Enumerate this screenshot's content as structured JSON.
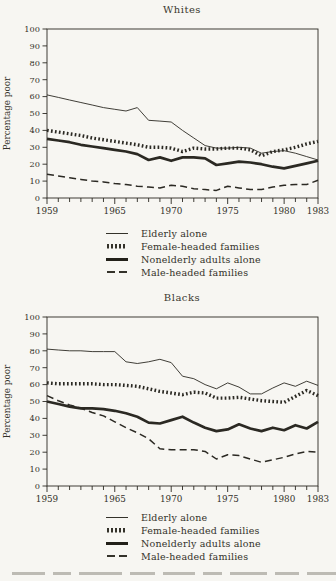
{
  "colors": {
    "ink": "#2b2923",
    "paper": "#f7f6f2"
  },
  "legend_items": [
    {
      "label": "Elderly alone",
      "style": "thin-solid"
    },
    {
      "label": "Female-headed families",
      "style": "dotted-thick"
    },
    {
      "label": "Nonelderly adults alone",
      "style": "thick-solid"
    },
    {
      "label": "Male-headed families",
      "style": "dashed"
    }
  ],
  "chart_data": [
    {
      "type": "line",
      "title": "Whites",
      "ylabel": "Percentage poor",
      "ylim": [
        0,
        100
      ],
      "y_tick_step": 10,
      "grid": false,
      "legend_position": "below",
      "x": [
        1959,
        1960,
        1961,
        1962,
        1963,
        1964,
        1965,
        1966,
        1967,
        1968,
        1969,
        1970,
        1971,
        1972,
        1973,
        1974,
        1975,
        1976,
        1977,
        1978,
        1979,
        1980,
        1981,
        1982,
        1983
      ],
      "x_axis_labeled_ticks": [
        1959,
        1965,
        1970,
        1975,
        1980,
        1983
      ],
      "series": [
        {
          "name": "Elderly alone",
          "style": "thin-solid",
          "values": [
            61,
            59.5,
            58,
            56.5,
            55,
            53.5,
            52.5,
            51.5,
            53.5,
            46,
            45.5,
            45,
            40,
            35.5,
            31,
            29.5,
            29.5,
            30,
            29.5,
            26.5,
            27.5,
            28,
            26.5,
            24.5,
            22.5
          ]
        },
        {
          "name": "Female-headed families",
          "style": "dotted-thick",
          "values": [
            40,
            39,
            38,
            37,
            35.5,
            34.5,
            33.5,
            32.5,
            31.5,
            30,
            30,
            29.5,
            27.5,
            29.5,
            29,
            29,
            29.5,
            29.5,
            28.5,
            25,
            27.5,
            28.5,
            30,
            32,
            33.5
          ]
        },
        {
          "name": "Nonelderly adults alone",
          "style": "thick-solid",
          "values": [
            35,
            34,
            33,
            31.5,
            30.5,
            29.5,
            28.5,
            27.5,
            26,
            22.5,
            24,
            22,
            24,
            24,
            23.5,
            19.5,
            20.5,
            21.5,
            21,
            20,
            18.5,
            17.5,
            19,
            20.5,
            22
          ]
        },
        {
          "name": "Male-headed families",
          "style": "dashed",
          "values": [
            14,
            13,
            12,
            11,
            10,
            9.5,
            8.5,
            8,
            7,
            6.5,
            6,
            7.5,
            7,
            5.5,
            5,
            4.5,
            7,
            6,
            5,
            5,
            6.5,
            7.5,
            8,
            8,
            10.5
          ]
        }
      ]
    },
    {
      "type": "line",
      "title": "Blacks",
      "ylabel": "Percentage poor",
      "ylim": [
        0,
        100
      ],
      "y_tick_step": 10,
      "grid": false,
      "legend_position": "below",
      "x": [
        1959,
        1960,
        1961,
        1962,
        1963,
        1964,
        1965,
        1966,
        1967,
        1968,
        1969,
        1970,
        1971,
        1972,
        1973,
        1974,
        1975,
        1976,
        1977,
        1978,
        1979,
        1980,
        1981,
        1982,
        1983
      ],
      "x_axis_labeled_ticks": [
        1959,
        1965,
        1970,
        1975,
        1980,
        1983
      ],
      "series": [
        {
          "name": "Elderly alone",
          "style": "thin-solid",
          "values": [
            81,
            80.5,
            80,
            80,
            79.5,
            79.5,
            79.5,
            73.5,
            72.5,
            73.5,
            75,
            73,
            65,
            63.5,
            60,
            57.5,
            61,
            58.5,
            54.5,
            54.5,
            58,
            61,
            59,
            62,
            59.5
          ]
        },
        {
          "name": "Female-headed families",
          "style": "dotted-thick",
          "values": [
            61,
            60.5,
            60.5,
            60.5,
            60.5,
            60,
            60,
            59.5,
            59,
            57.5,
            56,
            55,
            54,
            55.5,
            55,
            52,
            52,
            52.5,
            51.5,
            50.5,
            50,
            49.5,
            53,
            56.5,
            53.5
          ]
        },
        {
          "name": "Nonelderly adults alone",
          "style": "thick-solid",
          "values": [
            50,
            48.5,
            47,
            46,
            46,
            45.5,
            44.5,
            43,
            41,
            37.5,
            37,
            39,
            41,
            37.5,
            34.5,
            32.5,
            33.5,
            36.5,
            34,
            32.5,
            34.5,
            33,
            36,
            34,
            38
          ]
        },
        {
          "name": "Male-headed families",
          "style": "dashed",
          "values": [
            53.5,
            50.5,
            48,
            46,
            43.5,
            41.5,
            38,
            34.5,
            31.5,
            28,
            22,
            21.5,
            21.5,
            21.5,
            20.5,
            16,
            18.5,
            18,
            16,
            14,
            15.5,
            17,
            19,
            20.5,
            20
          ]
        }
      ]
    }
  ]
}
